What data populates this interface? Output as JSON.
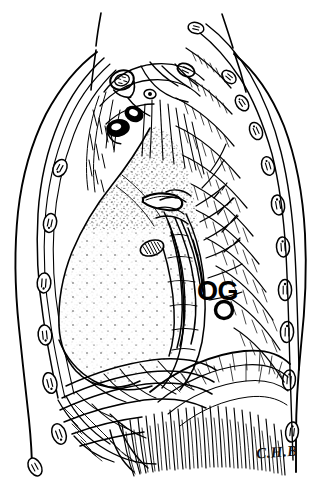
{
  "figure": {
    "kind": "anatomical-line-drawing",
    "technique": "pen-and-ink stipple and hatch",
    "background_color": "#ffffff",
    "ink_color": "#000000",
    "width": 331,
    "height": 485
  },
  "annotations": {
    "structure_label": "OG",
    "artist_signature": "C.H.B"
  },
  "structures": [
    {
      "name": "neck-contour-left",
      "label": "Left neck outline"
    },
    {
      "name": "neck-contour-right",
      "label": "Right neck outline"
    },
    {
      "name": "body-wall-outline",
      "label": "Thoracic body wall"
    },
    {
      "name": "lung",
      "label": "Lung (stippled)"
    },
    {
      "name": "aortic-arch",
      "label": "Aortic arch cut surface"
    },
    {
      "name": "great-vessels",
      "label": "Great vessel stumps at thoracic inlet"
    },
    {
      "name": "esophagus-vagal-plexus",
      "label": "Oesophagus with vagal plexus"
    },
    {
      "name": "ribs-posterior",
      "label": "Posterior rib cross sections"
    },
    {
      "name": "ribs-anterior",
      "label": "Anterior rib cross sections"
    },
    {
      "name": "intercostal-muscles",
      "label": "Intercostal muscles"
    },
    {
      "name": "diaphragm",
      "label": "Diaphragm dome"
    },
    {
      "name": "diaphragm-fibers",
      "label": "Radiating diaphragmatic muscle fibers"
    },
    {
      "name": "pericardial-fat",
      "label": "Mediastinal / pericardial connective tissue"
    }
  ]
}
